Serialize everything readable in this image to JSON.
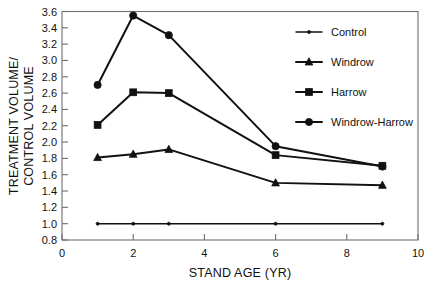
{
  "chart_data": {
    "type": "line",
    "title": "",
    "xlabel": "STAND AGE (YR)",
    "ylabel": "TREATMENT VOLUME/ CONTROL VOLUME",
    "ylabel_line1": "TREATMENT VOLUME/",
    "ylabel_line2": "CONTROL VOLUME",
    "x": [
      1,
      2,
      3,
      6,
      9
    ],
    "xlim": [
      0,
      10
    ],
    "ylim": [
      0.8,
      3.6
    ],
    "xticks": [
      0,
      2,
      4,
      6,
      8,
      10
    ],
    "xtick_labels": [
      "0",
      "2",
      "4",
      "6",
      "8",
      "10"
    ],
    "yticks": [
      0.8,
      1.0,
      1.2,
      1.4,
      1.6,
      1.8,
      2.0,
      2.2,
      2.4,
      2.6,
      2.8,
      3.0,
      3.2,
      3.4,
      3.6
    ],
    "ytick_labels": [
      "0.8",
      "1.0",
      "1.2",
      "1.4",
      "1.6",
      "1.8",
      "2.0",
      "2.2",
      "2.4",
      "2.6",
      "2.8",
      "3.0",
      "3.2",
      "3.4",
      "3.6"
    ],
    "grid": false,
    "legend_position": "top-right",
    "series": [
      {
        "name": "Control",
        "marker": "dot",
        "values": [
          1.0,
          1.0,
          1.0,
          1.0,
          1.0
        ]
      },
      {
        "name": "Windrow",
        "marker": "triangle",
        "values": [
          1.81,
          1.85,
          1.91,
          1.5,
          1.47
        ]
      },
      {
        "name": "Harrow",
        "marker": "square",
        "values": [
          2.21,
          2.61,
          2.6,
          1.84,
          1.71
        ]
      },
      {
        "name": "Windrow-Harrow",
        "marker": "circle",
        "values": [
          2.7,
          3.55,
          3.31,
          1.95,
          1.7
        ]
      }
    ]
  },
  "legend": {
    "items": [
      {
        "label": "Control",
        "marker": "dot"
      },
      {
        "label": "Windrow",
        "marker": "triangle"
      },
      {
        "label": "Harrow",
        "marker": "square"
      },
      {
        "label": "Windrow-Harrow",
        "marker": "circle"
      }
    ]
  },
  "colors": {
    "ink": "#111111",
    "frame": "#6f6f6f",
    "background": "#ffffff"
  }
}
